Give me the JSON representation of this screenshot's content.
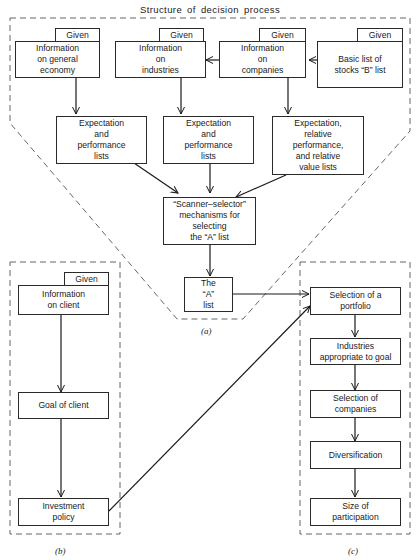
{
  "diagram": {
    "title": "Structure of decision process",
    "given_label": "Given",
    "panel_a": {
      "caption": "(a)",
      "inputs": [
        {
          "label": "Information\non general\neconomy",
          "given": "Given"
        },
        {
          "label": "Information\non\nindustries",
          "given": "Given"
        },
        {
          "label": "Information\non\ncompanies",
          "given": "Given"
        },
        {
          "label": "Basic list of\nstocks “B” list",
          "given": "Given"
        }
      ],
      "lists": [
        {
          "label": "Expectation\nand\nperformance\nlists"
        },
        {
          "label": "Expectation\nand\nperformance\nlists"
        },
        {
          "label": "Expectation,\nrelative\nperformance,\nand relative\nvalue lists"
        }
      ],
      "scanner": {
        "label": "“Scanner–selector”\nmechanisms for\nselecting\nthe “A” list"
      },
      "a_list": {
        "label": "The\n“A”\nlist"
      }
    },
    "panel_b": {
      "caption": "(b)",
      "nodes": [
        {
          "label": "Information\non client",
          "given": "Given"
        },
        {
          "label": "Goal of client"
        },
        {
          "label": "Investment\npolicy"
        }
      ]
    },
    "panel_c": {
      "caption": "(c)",
      "nodes": [
        {
          "label": "Selection of a\nportfolio"
        },
        {
          "label": "Industries\nappropriate to goal"
        },
        {
          "label": "Selection of\ncompanies"
        },
        {
          "label": "Diversification"
        },
        {
          "label": "Size of\nparticipation"
        }
      ]
    },
    "edges": [
      {
        "from": "Information on companies",
        "to": "Information on industries"
      },
      {
        "from": "Basic list of stocks B list",
        "to": "Information on companies"
      },
      {
        "from": "Information on general economy",
        "to": "Expectation and performance lists (1)"
      },
      {
        "from": "Information on industries",
        "to": "Expectation and performance lists (2)"
      },
      {
        "from": "Information on companies",
        "to": "Expectation, relative performance, and relative value lists"
      },
      {
        "from": "Expectation and performance lists (1)",
        "to": "Scanner-selector mechanisms"
      },
      {
        "from": "Expectation and performance lists (2)",
        "to": "Scanner-selector mechanisms"
      },
      {
        "from": "Expectation, relative performance, and relative value lists",
        "to": "Scanner-selector mechanisms"
      },
      {
        "from": "Scanner-selector mechanisms",
        "to": "The A list"
      },
      {
        "from": "The A list",
        "to": "Selection of a portfolio"
      },
      {
        "from": "Information on client",
        "to": "Goal of client"
      },
      {
        "from": "Goal of client",
        "to": "Investment policy"
      },
      {
        "from": "Investment policy",
        "to": "Selection of a portfolio"
      },
      {
        "from": "Selection of a portfolio",
        "to": "Industries appropriate to goal"
      },
      {
        "from": "Industries appropriate to goal",
        "to": "Selection of companies"
      },
      {
        "from": "Selection of companies",
        "to": "Diversification"
      },
      {
        "from": "Diversification",
        "to": "Size of participation"
      }
    ]
  }
}
